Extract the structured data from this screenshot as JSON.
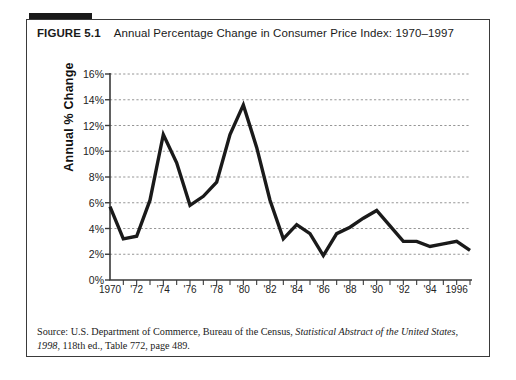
{
  "figure": {
    "label": "FIGURE 5.1",
    "caption": "Annual Percentage  Change in Consumer Price Index: 1970–1997",
    "source_line1_plain_a": "Source: U.S. Department of Commerce, Bureau of the Census, ",
    "source_line1_italic": "Statistical Abstract of the United States,",
    "source_line2_italic": "1998",
    "source_line2_plain": ", 118th ed., Table 772, page 489."
  },
  "chart_data": {
    "type": "line",
    "title": "Annual Percentage  Change in Consumer Price Index: 1970–1997",
    "xlabel": "",
    "ylabel": "Annual % Change",
    "xlim": [
      1970,
      1997
    ],
    "ylim": [
      0,
      16
    ],
    "ytick_labels": [
      "16%",
      "14%",
      "12%",
      "10%",
      "8%",
      "6%",
      "4%",
      "2%",
      "0%"
    ],
    "ytick_values": [
      16,
      14,
      12,
      10,
      8,
      6,
      4,
      2,
      0
    ],
    "xtick_labels": [
      "1970",
      "'72",
      "'74",
      "'76",
      "'78",
      "'80",
      "'82",
      "'84",
      "'86",
      "'88",
      "'90",
      "'92",
      "'94",
      "1996"
    ],
    "xtick_values": [
      1970,
      1972,
      1974,
      1976,
      1978,
      1980,
      1982,
      1984,
      1986,
      1988,
      1990,
      1992,
      1994,
      1996
    ],
    "grid": "horizontal-dashed",
    "legend": "none",
    "line_color": "#1a1a1a",
    "grid_color": "#8a8a8a",
    "axis_color": "#3a3a3a",
    "x": [
      1970,
      1971,
      1972,
      1973,
      1974,
      1975,
      1976,
      1977,
      1978,
      1979,
      1980,
      1981,
      1982,
      1983,
      1984,
      1985,
      1986,
      1987,
      1988,
      1989,
      1990,
      1991,
      1992,
      1993,
      1994,
      1995,
      1996,
      1997
    ],
    "values": [
      5.7,
      3.2,
      3.4,
      6.2,
      11.3,
      9.1,
      5.8,
      6.5,
      7.6,
      11.3,
      13.6,
      10.3,
      6.2,
      3.2,
      4.3,
      3.6,
      1.9,
      3.6,
      4.1,
      4.8,
      5.4,
      4.2,
      3.0,
      3.0,
      2.6,
      2.8,
      3.0,
      2.3
    ],
    "series_name": "Annual % Change in CPI"
  }
}
